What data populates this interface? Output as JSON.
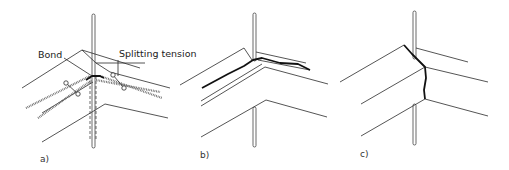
{
  "figure": {
    "panels": [
      {
        "id": "a",
        "label": "a)",
        "annotations": [
          "Bond",
          "Splitting tension"
        ]
      },
      {
        "id": "b",
        "label": "b)"
      },
      {
        "id": "c",
        "label": "c)"
      }
    ]
  },
  "colors": {
    "line": "#2a2a2a",
    "crack": "#111111",
    "background": "#ffffff"
  }
}
